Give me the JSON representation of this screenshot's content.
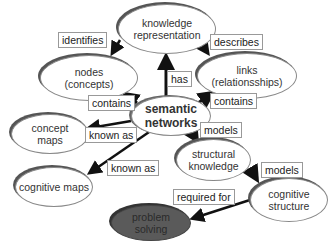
{
  "diagram": {
    "nodes": {
      "knowledge_representation": "knowledge\nrepresentation",
      "nodes_concepts": "nodes\n(concepts)",
      "links_relationships": "links\n(relationsships)",
      "semantic_networks": "semantic\nnetworks",
      "concept_maps": "concept\nmaps",
      "structural_knowledge": "structural\nknowledge",
      "cognitive_maps": "cognitive maps",
      "cognitive_structure": "cognitive\nstructure",
      "problem_solving": "problem\nsolving"
    },
    "edge_labels": {
      "identifies": "identifies",
      "describes": "describes",
      "has": "has",
      "contains_nodes": "contains",
      "contains_links": "contains",
      "known_as_concept": "known as",
      "known_as_cognitive": "known as",
      "models_structural": "models",
      "models_cognitive": "models",
      "required_for": "required for"
    },
    "colors": {
      "arrow": "#111111",
      "node_fill": "#ffffff",
      "dark_node_fill": "#5a5a5a"
    }
  }
}
